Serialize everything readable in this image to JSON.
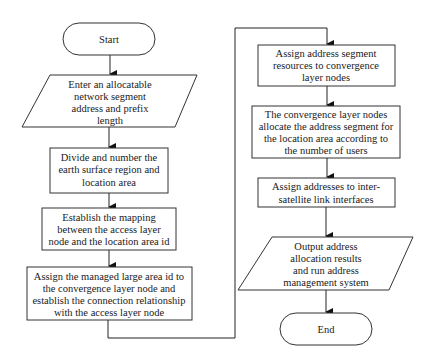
{
  "diagram": {
    "type": "flowchart",
    "nodes": [
      {
        "id": "start",
        "shape": "terminator",
        "lines": [
          "Start"
        ]
      },
      {
        "id": "input",
        "shape": "parallelogram",
        "lines": [
          "Enter an allocatable",
          "network segment",
          "address and prefix",
          "length"
        ]
      },
      {
        "id": "divide",
        "shape": "rectangle",
        "lines": [
          "Divide and number the",
          "earth surface region and",
          "location area"
        ]
      },
      {
        "id": "mapping",
        "shape": "rectangle",
        "lines": [
          "Establish the mapping",
          "between the access layer",
          "node and the location area id"
        ]
      },
      {
        "id": "assign-large-area",
        "shape": "rectangle",
        "lines": [
          "Assign the managed large area id to",
          "the convergence layer node and",
          "establish the connection relationship",
          "with the access layer node"
        ]
      },
      {
        "id": "assign-segment",
        "shape": "rectangle",
        "lines": [
          "Assign address segment",
          "resources to convergence",
          "layer nodes"
        ]
      },
      {
        "id": "allocate-location",
        "shape": "rectangle",
        "lines": [
          "The convergence layer nodes",
          "allocate the address segment for",
          "the location area according to",
          "the number of users"
        ]
      },
      {
        "id": "assign-isl",
        "shape": "rectangle",
        "lines": [
          "Assign addresses to inter-",
          "satellite link interfaces"
        ]
      },
      {
        "id": "output",
        "shape": "parallelogram",
        "lines": [
          "Output address",
          "allocation results",
          "and run address",
          "management system"
        ]
      },
      {
        "id": "end",
        "shape": "terminator",
        "lines": [
          "End"
        ]
      }
    ],
    "edges": [
      {
        "from": "start",
        "to": "input"
      },
      {
        "from": "input",
        "to": "divide"
      },
      {
        "from": "divide",
        "to": "mapping"
      },
      {
        "from": "mapping",
        "to": "assign-large-area"
      },
      {
        "from": "assign-large-area",
        "to": "assign-segment"
      },
      {
        "from": "assign-segment",
        "to": "allocate-location"
      },
      {
        "from": "allocate-location",
        "to": "assign-isl"
      },
      {
        "from": "assign-isl",
        "to": "output"
      },
      {
        "from": "output",
        "to": "end"
      }
    ]
  }
}
